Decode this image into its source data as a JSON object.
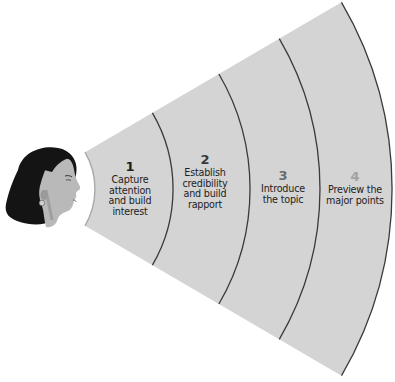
{
  "diagram": {
    "title": "",
    "apex": {
      "x": 22,
      "y": 189
    },
    "half_angle_deg": 30.3,
    "fill_color": "#d4d4d4",
    "inner_arc": {
      "radius": 73,
      "color": "#a8a8a8"
    },
    "arc_color": "#3a3a3a",
    "stages": [
      {
        "number": "1",
        "number_color": "#1e1e1e",
        "lines": [
          "Capture",
          "attention",
          "and build",
          "interest"
        ],
        "outer_radius": 151,
        "label_x": 130,
        "label_y": 160
      },
      {
        "number": "2",
        "number_color": "#3a3a3a",
        "lines": [
          "Establish",
          "credibility",
          "and build",
          "rapport"
        ],
        "outer_radius": 228,
        "label_x": 205,
        "label_y": 153
      },
      {
        "number": "3",
        "number_color": "#6c6c6c",
        "lines": [
          "Introduce",
          "the topic"
        ],
        "outer_radius": 298,
        "label_x": 283,
        "label_y": 169
      },
      {
        "number": "4",
        "number_color": "#a2a2a2",
        "lines": [
          "Preview the",
          "major points"
        ],
        "outer_radius": 370,
        "label_x": 355,
        "label_y": 170
      }
    ],
    "speaker_image": "woman-profile-head"
  }
}
